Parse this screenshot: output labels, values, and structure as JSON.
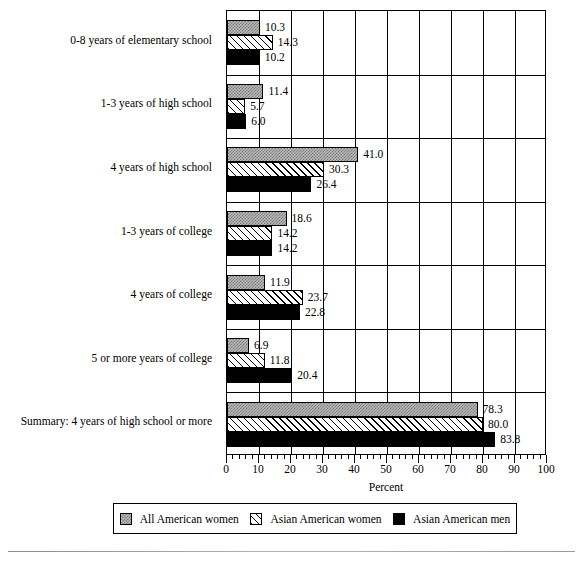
{
  "chart_data": {
    "type": "bar",
    "orientation": "horizontal",
    "title": "",
    "xlabel": "Percent",
    "ylabel": "",
    "xlim": [
      0,
      100
    ],
    "xticks": [
      0,
      10,
      20,
      30,
      40,
      50,
      60,
      70,
      80,
      90,
      100
    ],
    "xtick_labels": [
      "0",
      "10",
      "20",
      "30",
      "40",
      "50",
      "60",
      "70",
      "80",
      "90",
      "100"
    ],
    "minor_tick_step": 2,
    "grid": "vertical gridlines at every major tick; horizontal separators between categories",
    "legend_position": "below plot, horizontal box",
    "categories": [
      "0-8 years of elementary school",
      "1-3 years of high school",
      "4 years of high school",
      "1-3 years of college",
      "4 years of college",
      "5 or more years of college",
      "Summary: 4 years of high school or more"
    ],
    "series": [
      {
        "name": "All American women",
        "pattern": "stipple-gray",
        "color": "#b9b9b9",
        "values": [
          10.3,
          11.4,
          41.0,
          18.6,
          11.9,
          6.9,
          78.3
        ],
        "labels": [
          "10.3",
          "11.4",
          "41.0",
          "18.6",
          "11.9",
          "6.9",
          "78.3"
        ]
      },
      {
        "name": "Asian American women",
        "pattern": "diagonal-hatch",
        "color": "#ffffff",
        "values": [
          14.3,
          5.7,
          30.3,
          14.2,
          23.7,
          11.8,
          80.0
        ],
        "labels": [
          "14.3",
          "5.7",
          "30.3",
          "14.2",
          "23.7",
          "11.8",
          "80.0"
        ]
      },
      {
        "name": "Asian American men",
        "pattern": "solid-black",
        "color": "#000000",
        "values": [
          10.2,
          6.0,
          26.4,
          14.2,
          22.8,
          20.4,
          83.8
        ],
        "labels": [
          "10.2",
          "6.0",
          "26.4",
          "14.2",
          "22.8",
          "20.4",
          "83.8"
        ]
      }
    ]
  },
  "axis": {
    "x_title": "Percent"
  },
  "legend": {
    "items": [
      {
        "label": "All American women"
      },
      {
        "label": "Asian American women"
      },
      {
        "label": "Asian American men"
      }
    ]
  }
}
